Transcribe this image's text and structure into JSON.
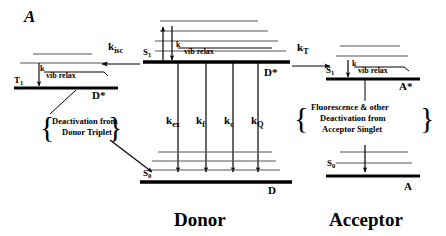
{
  "figure": {
    "panel_label": "A",
    "width": 446,
    "height": 236,
    "background": "#ffffff",
    "ink_color": "#000000",
    "vib_level_color": "#555555"
  },
  "donor": {
    "title": "Donor",
    "excited_state_label": "D*",
    "ground_state_label": "D",
    "singlet_label": "S",
    "singlet_sub": "1",
    "ground_label": "S",
    "ground_sub": "0",
    "vib_relax_k": "k",
    "vib_relax_text": "vib relax",
    "n_vib_above_s1": 4,
    "n_vib_above_s0": 3,
    "rates": [
      {
        "symbol": "k",
        "sub": "ex",
        "name": "k-ex"
      },
      {
        "symbol": "k",
        "sub": "f",
        "name": "k-f"
      },
      {
        "symbol": "k",
        "sub": "c",
        "name": "k-c"
      },
      {
        "symbol": "k",
        "sub": "Q",
        "name": "k-Q"
      }
    ]
  },
  "triplet": {
    "state_label": "T",
    "state_sub": "1",
    "species_label": "D*",
    "vib_relax_k": "k",
    "vib_relax_text": "vib relax",
    "n_vib_above_t1": 2,
    "annotation_lines": [
      "Deactivation from",
      "Donor Triplet"
    ],
    "brace_left": "{",
    "brace_right": "}"
  },
  "acceptor": {
    "title": "Acceptor",
    "excited_state_label": "A*",
    "ground_state_label": "A",
    "singlet_label": "S",
    "singlet_sub": "1",
    "ground_label": "S",
    "ground_sub": "0",
    "vib_relax_k": "k",
    "vib_relax_text": "vib relax",
    "n_vib_above_s1": 2,
    "n_vib_above_s0": 2,
    "annotation_lines": [
      "Fluorescence & other",
      "Deactivation from",
      "Acceptor Singlet"
    ],
    "brace_left": "{",
    "brace_right": "}"
  },
  "transfer": {
    "isc": {
      "symbol": "k",
      "sub": "isc",
      "name": "k-isc"
    },
    "energy_transfer": {
      "symbol": "k",
      "sub": "T",
      "name": "k-T"
    }
  }
}
